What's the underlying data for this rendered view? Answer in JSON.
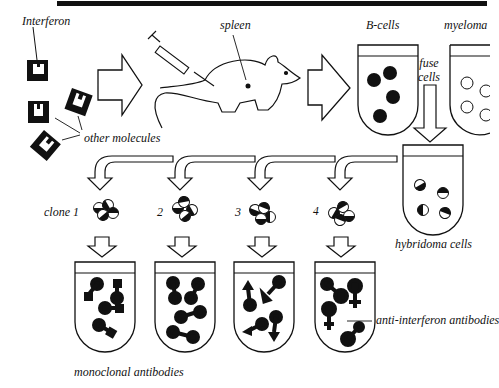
{
  "title_bar": {
    "color": "#111111"
  },
  "labels": {
    "interferon": "Interferon",
    "other_molecules": "other molecules",
    "spleen": "spleen",
    "b_cells": "B-cells",
    "myeloma": "myeloma",
    "fuse_line1": "fuse",
    "fuse_line2": "cells",
    "hybridoma_cells": "hybridoma cells",
    "clone1": "clone 1",
    "clone2": "2",
    "clone3": "3",
    "clone4": "4",
    "monoclonal_antibodies": "monoclonal antibodies",
    "anti_interferon_antibodies": "anti-interferon antibodies"
  },
  "colors": {
    "ink": "#111111",
    "paper": "#ffffff"
  },
  "steps": [
    "Interferon injected into mouse",
    "B-cells harvested from spleen",
    "B-cells fused with myeloma cells",
    "Hybridoma cells split into clones 1-4",
    "Each clone produces monoclonal antibodies"
  ]
}
